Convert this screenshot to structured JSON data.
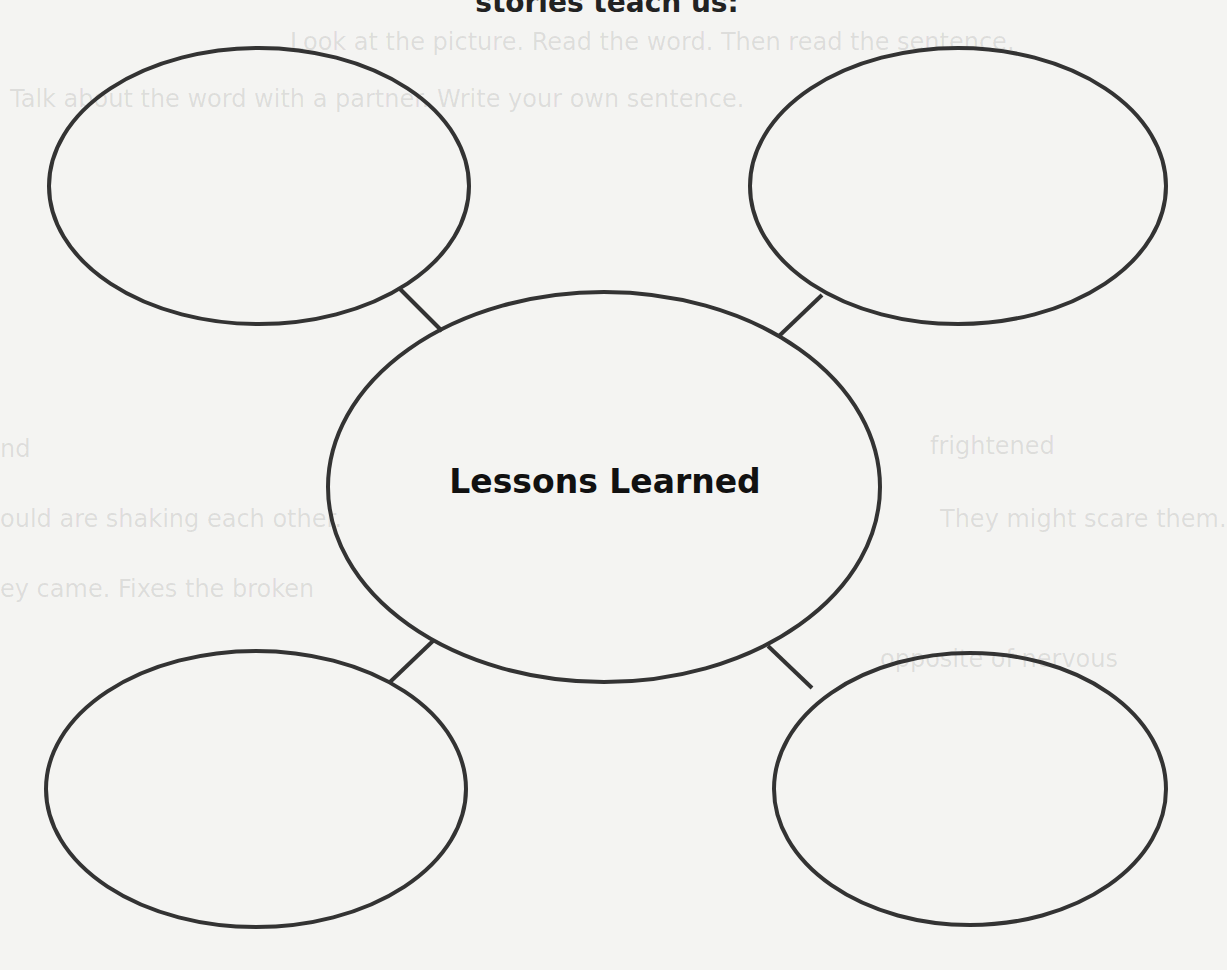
{
  "header": {
    "partial_title": "stories teach us:"
  },
  "bleed_through_text": [
    "Look at the picture. Read the word. Then read the sentence.",
    "Talk about the word with a partner. Write your own sentence.",
    "nd",
    "frightened",
    "ould are shaking each other.",
    "They might scare them.",
    "ey came. Fixes the broken",
    "opposite of nervous"
  ],
  "web": {
    "center_label": "Lessons Learned",
    "outer_nodes": [
      {
        "position": "top-left",
        "text": ""
      },
      {
        "position": "top-right",
        "text": ""
      },
      {
        "position": "bottom-left",
        "text": ""
      },
      {
        "position": "bottom-right",
        "text": ""
      }
    ],
    "stroke_color": "#333333"
  }
}
